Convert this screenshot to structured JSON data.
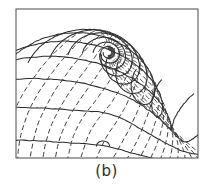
{
  "figure": {
    "caption": "(b)",
    "kind": "flow-net",
    "background_color": "#ffffff",
    "ink_color": "#2b2b2b",
    "frame": {
      "x": 16,
      "y": 9,
      "width": 182,
      "height": 149,
      "stroke_color": "#4a4a4a",
      "stroke_width": 1
    },
    "singularity": {
      "label": "source-point",
      "x": 108,
      "y": 55
    },
    "stagnation": {
      "label": "stagnation-point",
      "x": 103,
      "y": 141
    },
    "line_styles": {
      "solid": {
        "name": "flow-line",
        "color": "#2b2b2b",
        "width": 1.05,
        "dash": "none"
      },
      "dashed": {
        "name": "equipotential-line",
        "color": "#3a3a3a",
        "width": 1.0,
        "dash": "5 3"
      }
    }
  },
  "chart_data": {
    "type": "line",
    "title": "(b)",
    "xlabel": "",
    "ylabel": "",
    "xlim": [
      16,
      198
    ],
    "ylim": [
      9,
      158
    ],
    "grid": false,
    "legend": null,
    "source_point": [
      108,
      55
    ],
    "stagnation_point": [
      103,
      141
    ],
    "series": [
      {
        "name": "flow-lines-solid",
        "style": "solid",
        "count": 15,
        "radii": [
          6,
          11,
          17,
          24,
          32,
          41,
          51,
          62,
          74,
          87,
          101,
          116,
          132,
          149,
          167
        ]
      },
      {
        "name": "equipotential-lines-dashed",
        "style": "dashed",
        "count": 19,
        "angles_deg": [
          -86,
          -76,
          -66,
          -56,
          -46,
          -36,
          -26,
          -16,
          -6,
          4,
          14,
          24,
          34,
          44,
          54,
          64,
          74,
          84,
          94
        ]
      }
    ]
  }
}
